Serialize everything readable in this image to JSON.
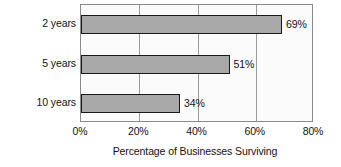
{
  "chart_data": {
    "type": "bar",
    "orientation": "horizontal",
    "title": "",
    "categories": [
      "2 years",
      "5 years",
      "10 years"
    ],
    "values": [
      69,
      51,
      34
    ],
    "value_labels": [
      "69%",
      "51%",
      "34%"
    ],
    "xlabel": "Percentage of Businesses Surviving",
    "ylabel": "Years since Being Started",
    "xlim": [
      0,
      80
    ],
    "xticks": [
      0,
      20,
      40,
      60,
      80
    ],
    "xtick_labels": [
      "0%",
      "20%",
      "40%",
      "60%",
      "80%"
    ],
    "grid": "vertical",
    "legend": "none",
    "colors": {
      "bar_fill": "#a8a8a8",
      "bar_border": "#1a1a1a",
      "plot_background": "#fbfbfb",
      "plot_border": "#8a8a8a",
      "gridline": "#9a9a9a",
      "text": "#111111"
    }
  }
}
